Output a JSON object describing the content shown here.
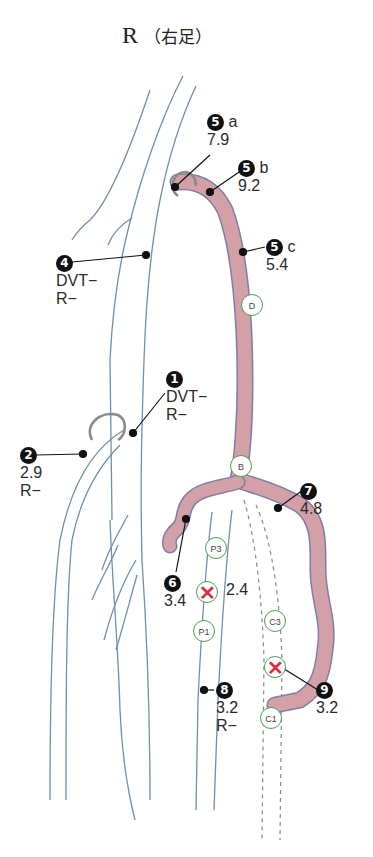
{
  "title": {
    "side": "R",
    "side_jp": "（右足）"
  },
  "points": [
    {
      "id": "1",
      "lines": [
        "DVT−",
        "R−"
      ]
    },
    {
      "id": "2",
      "lines": [
        "2.9",
        "R−"
      ]
    },
    {
      "id": "4",
      "lines": [
        "DVT−",
        "R−"
      ]
    },
    {
      "id": "5a",
      "badge": "5",
      "suffix": "a",
      "lines": [
        "7.9"
      ]
    },
    {
      "id": "5b",
      "badge": "5",
      "suffix": "b",
      "lines": [
        "9.2"
      ]
    },
    {
      "id": "5c",
      "badge": "5",
      "suffix": "c",
      "lines": [
        "5.4"
      ]
    },
    {
      "id": "6",
      "lines": [
        "3.4"
      ]
    },
    {
      "id": "7",
      "lines": [
        "4.8"
      ]
    },
    {
      "id": "8",
      "lines": [
        "3.2",
        "R−"
      ]
    },
    {
      "id": "9",
      "lines": [
        "3.2"
      ]
    }
  ],
  "perforator_markers": [
    {
      "label": "D",
      "status": "normal"
    },
    {
      "label": "B",
      "status": "normal"
    },
    {
      "label": "P3",
      "status": "normal"
    },
    {
      "label": "P2",
      "status": "incompetent",
      "value": "2.4"
    },
    {
      "label": "P1",
      "status": "normal"
    },
    {
      "label": "C3",
      "status": "normal"
    },
    {
      "label": "C2",
      "status": "incompetent"
    },
    {
      "label": "C1",
      "status": "normal"
    }
  ],
  "colors": {
    "vein_outline": "#6f8fb0",
    "varicose_fill": "#d3a0a8",
    "varicose_outline": "#7d7fa8",
    "marker_ring": "#4aa04a",
    "incompetent_x": "#d8304a",
    "valve_ring": "#8a8a8a"
  }
}
